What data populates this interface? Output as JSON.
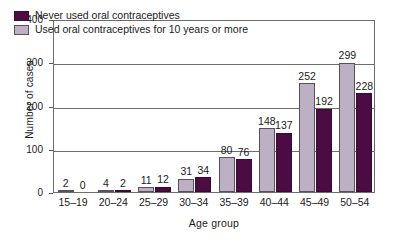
{
  "chart_data": {
    "type": "bar",
    "title": "",
    "xlabel": "Age group",
    "ylabel": "Number of cases",
    "categories": [
      "15–19",
      "20–24",
      "25–29",
      "30–34",
      "35–39",
      "40–44",
      "45–49",
      "50–54"
    ],
    "series": [
      {
        "name": "Used oral contraceptives for 10 years or more",
        "color": "#bdb0c4",
        "values": [
          2,
          4,
          11,
          31,
          80,
          148,
          252,
          299
        ]
      },
      {
        "name": "Never used oral contraceptives",
        "color": "#4a0c42",
        "values": [
          0,
          2,
          12,
          34,
          76,
          137,
          192,
          228
        ]
      }
    ],
    "ylim": [
      0,
      400
    ],
    "yticks": [
      0,
      100,
      200,
      300,
      400
    ],
    "ytick_labels": [
      "0",
      "100",
      "200",
      "300",
      "400"
    ],
    "grid": true,
    "grid_axis": "y",
    "legend_position": "top-left",
    "bar_order": "used-left-never-right",
    "value_labels": true
  },
  "legend": {
    "entries": [
      {
        "label": "Never used oral contraceptives",
        "swatch": "series-never"
      },
      {
        "label": "Used oral contraceptives for 10 years or more",
        "swatch": "series-used"
      }
    ]
  },
  "axes": {
    "y_title": "Number of cases",
    "x_title": "Age group"
  }
}
